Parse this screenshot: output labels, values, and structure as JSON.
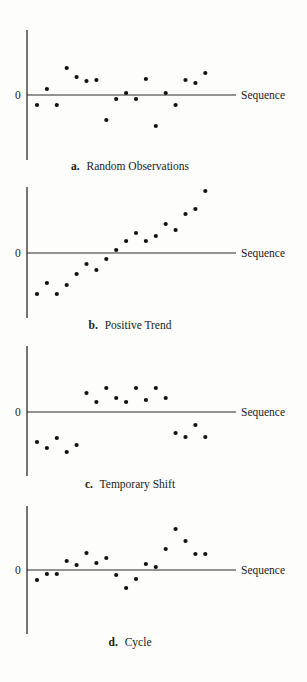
{
  "chart_data": [
    {
      "type": "scatter",
      "panel": "a",
      "title": "Random Observations",
      "caption_letter": "a.",
      "xlabel": "Sequence",
      "ylabel": "",
      "zero_label": "0",
      "grid": false,
      "x": [
        1,
        2,
        3,
        4,
        5,
        6,
        7,
        8,
        9,
        10,
        11,
        12,
        13,
        14,
        15,
        16,
        17,
        18
      ],
      "values": [
        -10,
        6,
        -10,
        27,
        18,
        14,
        15,
        -25,
        -4,
        2,
        -4,
        16,
        -31,
        2,
        -10,
        15,
        12,
        22
      ],
      "ylim": [
        -65,
        65
      ]
    },
    {
      "type": "scatter",
      "panel": "b",
      "title": "Positive Trend",
      "caption_letter": "b.",
      "xlabel": "Sequence",
      "ylabel": "",
      "zero_label": "0",
      "grid": false,
      "x": [
        1,
        2,
        3,
        4,
        5,
        6,
        7,
        8,
        9,
        10,
        11,
        12,
        13,
        14,
        15,
        16,
        17,
        18
      ],
      "values": [
        -41,
        -30,
        -41,
        -32,
        -21,
        -11,
        -17,
        -6,
        3,
        12,
        20,
        12,
        17,
        29,
        23,
        39,
        44,
        62
      ],
      "ylim": [
        -65,
        66
      ]
    },
    {
      "type": "scatter",
      "panel": "c",
      "title": "Temporary Shift",
      "caption_letter": "c.",
      "xlabel": "Sequence",
      "ylabel": "",
      "zero_label": "0",
      "grid": false,
      "x": [
        1,
        2,
        3,
        4,
        5,
        6,
        7,
        8,
        9,
        10,
        11,
        12,
        13,
        14,
        15,
        16,
        17,
        18
      ],
      "values": [
        -30,
        -36,
        -26,
        -40,
        -33,
        19,
        10,
        24,
        14,
        10,
        24,
        12,
        24,
        14,
        -21,
        -25,
        -13,
        -25
      ],
      "ylim": [
        -64,
        66
      ]
    },
    {
      "type": "scatter",
      "panel": "d",
      "title": "Cycle",
      "caption_letter": "d.",
      "xlabel": "Sequence",
      "ylabel": "",
      "zero_label": "0",
      "grid": false,
      "x": [
        1,
        2,
        3,
        4,
        5,
        6,
        7,
        8,
        9,
        10,
        11,
        12,
        13,
        14,
        15,
        16,
        17,
        18
      ],
      "values": [
        -10,
        -4,
        -4,
        9,
        5,
        17,
        7,
        12,
        -5,
        -18,
        -9,
        6,
        3,
        21,
        41,
        29,
        16,
        16
      ],
      "ylim": [
        -64,
        64
      ]
    }
  ],
  "layout": {
    "axis_x": 27,
    "line_end_x": 236,
    "seq_label_x": 241,
    "zero_label_x": 15,
    "first_point_x": 37,
    "point_spacing": 9.9,
    "point_radius": 2.1,
    "caption_center_x": 130,
    "panels": [
      {
        "zero_y": 95,
        "axis_top": 30,
        "axis_bottom": 160,
        "caption_y": 170
      },
      {
        "zero_y": 253,
        "axis_top": 187,
        "axis_bottom": 318,
        "caption_y": 329
      },
      {
        "zero_y": 412,
        "axis_top": 346,
        "axis_bottom": 476,
        "caption_y": 488
      },
      {
        "zero_y": 570,
        "axis_top": 506,
        "axis_bottom": 634,
        "caption_y": 646
      }
    ]
  }
}
